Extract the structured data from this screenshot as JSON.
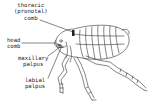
{
  "diagram": {
    "labels": [
      {
        "id": "thoracic",
        "lines": [
          "thoracic",
          "(pronotal)",
          "comb"
        ]
      },
      {
        "id": "head",
        "lines": [
          "head",
          "comb"
        ]
      },
      {
        "id": "maxillary",
        "lines": [
          "maxillary",
          "palpus"
        ]
      },
      {
        "id": "labial",
        "lines": [
          "labial",
          "palpus"
        ]
      }
    ],
    "colors": {
      "line": "#333333",
      "background": "#ffffff"
    }
  }
}
